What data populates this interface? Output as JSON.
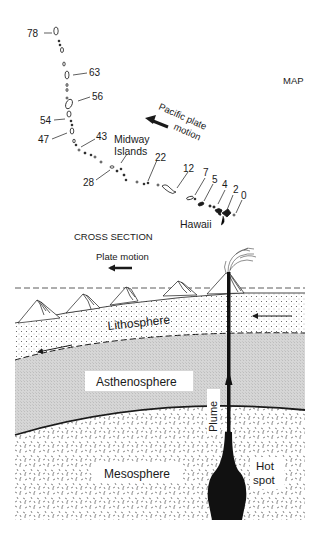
{
  "map": {
    "title": "MAP",
    "plate_motion_label_line1": "Pacific plate",
    "plate_motion_label_line2": "motion",
    "ages": [
      {
        "label": "78"
      },
      {
        "label": "63"
      },
      {
        "label": "56"
      },
      {
        "label": "54"
      },
      {
        "label": "47"
      },
      {
        "label": "43"
      },
      {
        "label": "28"
      },
      {
        "label": "22"
      },
      {
        "label": "12"
      },
      {
        "label": "7"
      },
      {
        "label": "5"
      },
      {
        "label": "4"
      },
      {
        "label": "2"
      },
      {
        "label": "0"
      }
    ],
    "midway_line1": "Midway",
    "midway_line2": "Islands",
    "hawaii": "Hawaii"
  },
  "cross_section": {
    "title": "CROSS SECTION",
    "plate_motion": "Plate motion",
    "layers": {
      "lithosphere": "Lithosphere",
      "asthenosphere": "Asthenosphere",
      "mesosphere": "Mesosphere"
    },
    "plume": "Plume",
    "hot_spot_line1": "Hot",
    "hot_spot_line2": "spot"
  },
  "colors": {
    "ink": "#1a1a1a",
    "asthenosphere_fill": "#d4d4d4",
    "background": "#ffffff"
  }
}
